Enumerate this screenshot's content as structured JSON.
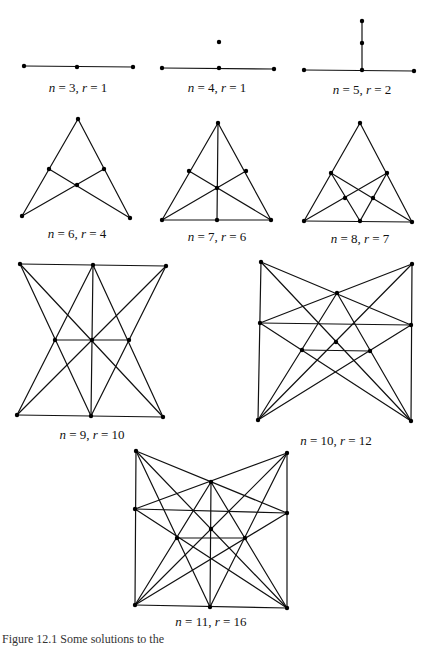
{
  "figure": {
    "caption_partial": "Figure 12.1  Some solutions to the",
    "diagrams": [
      {
        "id": "n3",
        "label": "n = 3, r = 1",
        "label_pos": [
          78,
          88
        ],
        "points": [
          [
            24,
            66
          ],
          [
            77,
            67
          ],
          [
            133,
            67
          ]
        ],
        "lines": [
          [
            0,
            2
          ]
        ]
      },
      {
        "id": "n4",
        "label": "n = 4, r = 1",
        "label_pos": [
          217,
          88
        ],
        "points": [
          [
            162,
            68
          ],
          [
            219,
            68
          ],
          [
            274,
            69
          ],
          [
            219,
            42
          ]
        ],
        "lines": [
          [
            0,
            2
          ]
        ]
      },
      {
        "id": "n5",
        "label": "n = 5, r = 2",
        "label_pos": [
          362,
          90
        ],
        "points": [
          [
            304,
            70
          ],
          [
            362,
            70
          ],
          [
            414,
            71
          ],
          [
            362,
            43
          ],
          [
            362,
            21
          ]
        ],
        "lines": [
          [
            0,
            2
          ],
          [
            1,
            4
          ]
        ]
      },
      {
        "id": "n6",
        "label": "n = 6, r = 4",
        "label_pos": [
          77,
          234
        ],
        "points": [
          [
            78,
            119
          ],
          [
            49,
            169
          ],
          [
            104,
            169
          ],
          [
            77,
            185
          ],
          [
            22,
            216
          ],
          [
            130,
            218
          ]
        ],
        "lines": [
          [
            0,
            4
          ],
          [
            0,
            5
          ],
          [
            1,
            5
          ],
          [
            2,
            4
          ]
        ]
      },
      {
        "id": "n7",
        "label": "n = 7, r = 6",
        "label_pos": [
          217,
          237
        ],
        "points": [
          [
            218,
            123
          ],
          [
            189,
            171
          ],
          [
            246,
            171
          ],
          [
            217,
            188
          ],
          [
            162,
            220
          ],
          [
            217,
            220
          ],
          [
            271,
            220
          ]
        ],
        "lines": [
          [
            0,
            4
          ],
          [
            0,
            6
          ],
          [
            0,
            5
          ],
          [
            4,
            6
          ],
          [
            1,
            6
          ],
          [
            2,
            4
          ]
        ]
      },
      {
        "id": "n8",
        "label": "n = 8, r = 7",
        "label_pos": [
          360,
          239
        ],
        "points": [
          [
            360,
            123
          ],
          [
            331,
            173
          ],
          [
            387,
            173
          ],
          [
            345,
            198
          ],
          [
            373,
            198
          ],
          [
            304,
            221
          ],
          [
            360,
            221
          ],
          [
            412,
            222
          ]
        ],
        "lines": [
          [
            0,
            5
          ],
          [
            0,
            7
          ],
          [
            5,
            7
          ],
          [
            1,
            6
          ],
          [
            1,
            7
          ],
          [
            2,
            5
          ],
          [
            2,
            6
          ]
        ]
      },
      {
        "id": "n9",
        "label": "n = 9, r = 10",
        "label_pos": [
          92,
          435
        ],
        "points": [
          [
            20,
            264
          ],
          [
            93,
            265
          ],
          [
            166,
            266
          ],
          [
            55,
            340
          ],
          [
            92,
            340
          ],
          [
            129,
            340
          ],
          [
            17,
            415
          ],
          [
            91,
            416
          ],
          [
            163,
            417
          ]
        ],
        "lines": [
          [
            0,
            2
          ],
          [
            6,
            8
          ],
          [
            3,
            5
          ],
          [
            1,
            7
          ],
          [
            0,
            8
          ],
          [
            2,
            6
          ],
          [
            0,
            7
          ],
          [
            1,
            6
          ],
          [
            1,
            8
          ],
          [
            2,
            7
          ]
        ]
      },
      {
        "id": "n10",
        "label": "n = 10, r = 12",
        "label_pos": [
          336,
          441
        ],
        "points": [
          [
            261,
            262
          ],
          [
            412,
            264
          ],
          [
            337,
            293
          ],
          [
            260,
            323
          ],
          [
            411,
            325
          ],
          [
            336,
            342
          ],
          [
            302,
            350
          ],
          [
            370,
            351
          ],
          [
            258,
            420
          ],
          [
            411,
            421
          ]
        ],
        "lines": [
          [
            0,
            8
          ],
          [
            1,
            9
          ],
          [
            0,
            4
          ],
          [
            1,
            3
          ],
          [
            3,
            4
          ],
          [
            0,
            9
          ],
          [
            1,
            8
          ],
          [
            2,
            8
          ],
          [
            2,
            9
          ],
          [
            3,
            9
          ],
          [
            4,
            8
          ],
          [
            6,
            7
          ]
        ]
      },
      {
        "id": "n11",
        "label": "n = 11, r = 16",
        "label_pos": [
          211,
          622
        ],
        "points": [
          [
            136,
            451
          ],
          [
            287,
            453
          ],
          [
            211,
            482
          ],
          [
            135,
            509
          ],
          [
            287,
            513
          ],
          [
            211,
            529
          ],
          [
            177,
            538
          ],
          [
            245,
            538
          ],
          [
            135,
            605
          ],
          [
            210,
            607
          ],
          [
            287,
            608
          ]
        ],
        "lines": [
          [
            0,
            8
          ],
          [
            1,
            10
          ],
          [
            8,
            10
          ],
          [
            2,
            9
          ],
          [
            0,
            4
          ],
          [
            1,
            3
          ],
          [
            3,
            4
          ],
          [
            0,
            10
          ],
          [
            1,
            8
          ],
          [
            2,
            8
          ],
          [
            2,
            10
          ],
          [
            3,
            10
          ],
          [
            4,
            8
          ],
          [
            6,
            7
          ],
          [
            0,
            9
          ],
          [
            1,
            9
          ]
        ]
      }
    ]
  }
}
